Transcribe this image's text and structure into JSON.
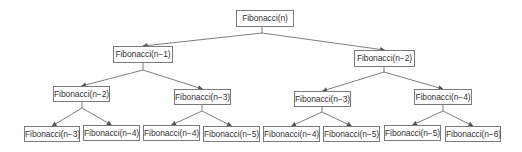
{
  "diagram": {
    "type": "recursion-tree",
    "colors": {
      "line": "#6e6e6e",
      "box_border": "#7a7a7a",
      "text": "#333333",
      "background": "#ffffff"
    },
    "nodes": [
      {
        "id": "n0",
        "label": "Fibonacci(n)",
        "x": 236,
        "y": 10,
        "w": 58,
        "h": 17,
        "level": 0
      },
      {
        "id": "n1",
        "label": "Fibonacci(n−1)",
        "x": 113,
        "y": 46,
        "w": 60,
        "h": 17,
        "level": 1
      },
      {
        "id": "n2",
        "label": "Fibonacci(n−2)",
        "x": 354,
        "y": 50,
        "w": 61,
        "h": 17,
        "level": 1
      },
      {
        "id": "n3",
        "label": "Fibonacci(n−2)",
        "x": 53,
        "y": 86,
        "w": 57,
        "h": 16,
        "level": 2
      },
      {
        "id": "n4",
        "label": "Fibonacci(n−3)",
        "x": 174,
        "y": 89,
        "w": 57,
        "h": 16,
        "level": 2
      },
      {
        "id": "n5",
        "label": "Fibonacci(n−3)",
        "x": 294,
        "y": 91,
        "w": 57,
        "h": 16,
        "level": 2
      },
      {
        "id": "n6",
        "label": "Fibonacci(n−4)",
        "x": 414,
        "y": 89,
        "w": 58,
        "h": 16,
        "level": 2
      },
      {
        "id": "n7",
        "label": "Fibonacci(n−3)",
        "x": 24,
        "y": 126,
        "w": 56,
        "h": 16,
        "level": 3
      },
      {
        "id": "n8",
        "label": "Fibonacci(n−4)",
        "x": 83,
        "y": 125,
        "w": 57,
        "h": 16,
        "level": 3
      },
      {
        "id": "n9",
        "label": "Fibonacci(n−4)",
        "x": 143,
        "y": 125,
        "w": 57,
        "h": 16,
        "level": 3
      },
      {
        "id": "n10",
        "label": "Fibonacci(n−5)",
        "x": 203,
        "y": 126,
        "w": 57,
        "h": 16,
        "level": 3
      },
      {
        "id": "n11",
        "label": "Fibonacci(n−4)",
        "x": 263,
        "y": 126,
        "w": 57,
        "h": 16,
        "level": 3
      },
      {
        "id": "n12",
        "label": "Fibonacci(n−5)",
        "x": 323,
        "y": 126,
        "w": 57,
        "h": 16,
        "level": 3
      },
      {
        "id": "n13",
        "label": "Fibonacci(n−5)",
        "x": 384,
        "y": 125,
        "w": 57,
        "h": 16,
        "level": 3
      },
      {
        "id": "n14",
        "label": "Fibonacci(n−6)",
        "x": 445,
        "y": 126,
        "w": 56,
        "h": 16,
        "level": 3
      }
    ],
    "edges": [
      {
        "from": "n0",
        "to": "n1",
        "junction": [
          262,
          33
        ]
      },
      {
        "from": "n0",
        "to": "n2",
        "junction": [
          262,
          33
        ]
      },
      {
        "from": "n1",
        "to": "n3",
        "junction": [
          143,
          70
        ]
      },
      {
        "from": "n1",
        "to": "n4",
        "junction": [
          143,
          70
        ]
      },
      {
        "from": "n2",
        "to": "n5",
        "junction": [
          384,
          72
        ]
      },
      {
        "from": "n2",
        "to": "n6",
        "junction": [
          384,
          72
        ]
      },
      {
        "from": "n3",
        "to": "n7",
        "junction": [
          82,
          108
        ]
      },
      {
        "from": "n3",
        "to": "n8",
        "junction": [
          82,
          108
        ]
      },
      {
        "from": "n4",
        "to": "n9",
        "junction": [
          202,
          111
        ]
      },
      {
        "from": "n4",
        "to": "n10",
        "junction": [
          202,
          111
        ]
      },
      {
        "from": "n5",
        "to": "n11",
        "junction": [
          322,
          112
        ]
      },
      {
        "from": "n5",
        "to": "n12",
        "junction": [
          322,
          112
        ]
      },
      {
        "from": "n6",
        "to": "n13",
        "junction": [
          443,
          111
        ]
      },
      {
        "from": "n6",
        "to": "n14",
        "junction": [
          443,
          111
        ]
      }
    ]
  }
}
